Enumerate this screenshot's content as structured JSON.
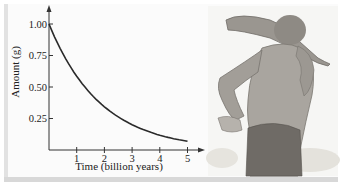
{
  "chart_data": {
    "type": "line",
    "title": "",
    "xlabel": "Time (billion years)",
    "ylabel": "Amount (g)",
    "x_ticks": [
      "1",
      "2",
      "3",
      "4",
      "5"
    ],
    "y_ticks": [
      "0.25",
      "0.50",
      "0.75",
      "1.00"
    ],
    "xlim": [
      0,
      5.4
    ],
    "ylim": [
      0,
      1.1
    ],
    "grid": false,
    "legend": null,
    "series": [
      {
        "name": "Amount remaining",
        "x": [
          0,
          0.5,
          1,
          1.5,
          2,
          2.5,
          3,
          3.5,
          4,
          4.5,
          5
        ],
        "y": [
          1.0,
          0.77,
          0.59,
          0.46,
          0.36,
          0.27,
          0.21,
          0.16,
          0.12,
          0.09,
          0.07
        ]
      }
    ]
  },
  "illustration": {
    "description": "pencil sketch of a prehistoric man carrying a club over his shoulder"
  }
}
